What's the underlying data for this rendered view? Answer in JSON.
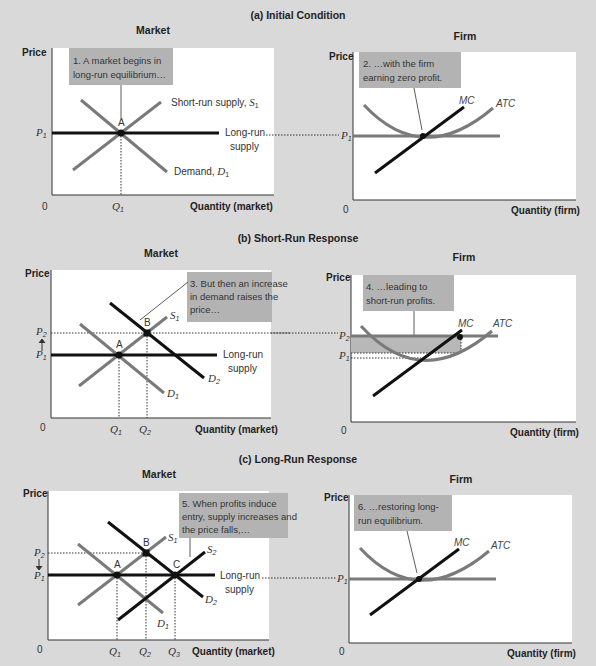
{
  "colors": {
    "background": "#d9d9d9",
    "plot_bg": "#ffffff",
    "curve_gray": "#7a7a7a",
    "curve_black": "#111111",
    "callout_bg": "#b3b3b3",
    "profit_shade": "#b8b8b8"
  },
  "panels": {
    "a": {
      "title": "(a) Initial Condition",
      "market": {
        "title": "Market",
        "ylabel": "Price",
        "xlabel": "Quantity (market)",
        "origin": "0",
        "callout": [
          "1. A market begins in",
          "long-run equilibrium…"
        ],
        "labels": {
          "srs": "Short-run supply, ",
          "srs_sym": "S",
          "demand": "Demand, ",
          "demand_sym": "D",
          "lrs1": "Long-run",
          "lrs2": "supply",
          "point_a": "A",
          "p1": "P",
          "q1": "Q",
          "sub1": "1"
        }
      },
      "firm": {
        "title": "Firm",
        "ylabel": "Price",
        "xlabel": "Quantity (firm)",
        "origin": "0",
        "callout": [
          "2. …with the firm",
          "earning zero profit."
        ],
        "labels": {
          "mc": "MC",
          "atc": "ATC",
          "p1": "P",
          "sub1": "1"
        }
      }
    },
    "b": {
      "title": "(b) Short-Run Response",
      "market": {
        "title": "Market",
        "ylabel": "Price",
        "xlabel": "Quantity (market)",
        "origin": "0",
        "callout": [
          "3. But then an increase",
          "in demand raises the",
          "price…"
        ],
        "labels": {
          "s1": "S",
          "d1": "D",
          "d2": "D",
          "lrs1": "Long-run",
          "lrs2": "supply",
          "point_a": "A",
          "point_b": "B",
          "p1": "P",
          "p2": "P",
          "q1": "Q",
          "q2": "Q",
          "sub1": "1",
          "sub2": "2"
        }
      },
      "firm": {
        "title": "Firm",
        "ylabel": "Price",
        "xlabel": "Quantity (firm)",
        "origin": "0",
        "callout": [
          "4. …leading to",
          "short-run profits."
        ],
        "labels": {
          "mc": "MC",
          "atc": "ATC",
          "p1": "P",
          "p2": "P",
          "sub1": "1",
          "sub2": "2"
        }
      }
    },
    "c": {
      "title": "(c) Long-Run Response",
      "market": {
        "title": "Market",
        "ylabel": "Price",
        "xlabel": "Quantity (market)",
        "origin": "0",
        "callout": [
          "5. When profits induce",
          "entry, supply increases and",
          "the price falls,…"
        ],
        "labels": {
          "s1": "S",
          "s2": "S",
          "d1": "D",
          "d2": "D",
          "lrs1": "Long-run",
          "lrs2": "supply",
          "point_a": "A",
          "point_b": "B",
          "point_c": "C",
          "p1": "P",
          "p2": "P",
          "q1": "Q",
          "q2": "Q",
          "q3": "Q",
          "sub1": "1",
          "sub2": "2",
          "sub3": "3"
        }
      },
      "firm": {
        "title": "Firm",
        "ylabel": "Price",
        "xlabel": "Quantity (firm)",
        "origin": "0",
        "callout": [
          "6. …restoring long-",
          "run equilibrium."
        ],
        "labels": {
          "mc": "MC",
          "atc": "ATC",
          "p1": "P",
          "sub1": "1"
        }
      }
    }
  }
}
